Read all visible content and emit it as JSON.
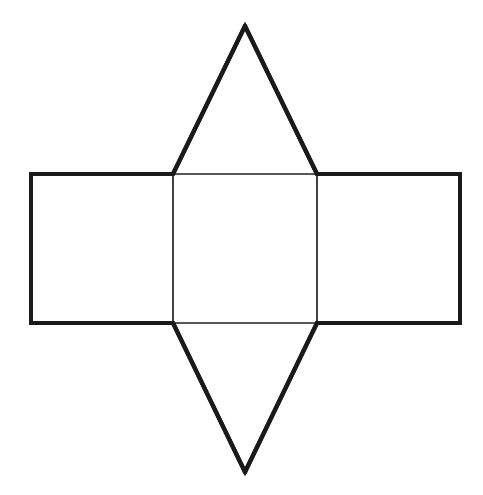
{
  "figure": {
    "title": "Net of a triangular prism",
    "background_color": "#ffffff",
    "stroke_color": "#1a1a1a",
    "inner_stroke_color": "#1f1f1f",
    "canvas": {
      "width": 483,
      "height": 495
    },
    "stroke_widths": {
      "outer_rectangle": 4,
      "triangle_edge": 4.4,
      "inner_fold_line": 1.7
    },
    "faces": [
      {
        "name": "left-rectangle",
        "shape": "rectangle",
        "points": "31,174 173,174 173,323 31,323",
        "width": 142,
        "height": 149
      },
      {
        "name": "center-rectangle",
        "shape": "rectangle",
        "points": "173,174 317,174 317,323 173,323",
        "width": 144,
        "height": 149
      },
      {
        "name": "right-rectangle",
        "shape": "rectangle",
        "points": "317,174 460,174 460,323 317,323",
        "width": 143,
        "height": 149
      },
      {
        "name": "top-triangle",
        "shape": "triangle",
        "points": "173,174 245,26 317,174",
        "apex": "245,26",
        "base_y": 174
      },
      {
        "name": "bottom-triangle",
        "shape": "triangle",
        "points": "173,323 245,472 317,323",
        "apex": "245,472",
        "base_y": 323
      }
    ],
    "outline_path": "M 31,174 L 173,174 L 245,26 L 317,174 L 460,174 L 460,323 L 317,323 L 245,472 L 173,323 L 31,323 Z",
    "fold_lines": [
      {
        "name": "fold-left-vertical",
        "points": "173,174 173,323"
      },
      {
        "name": "fold-right-vertical",
        "points": "317,174 317,323"
      },
      {
        "name": "fold-top-horizontal",
        "points": "173,174 317,174"
      },
      {
        "name": "fold-bottom-horizontal",
        "points": "173,323 317,323"
      }
    ]
  }
}
